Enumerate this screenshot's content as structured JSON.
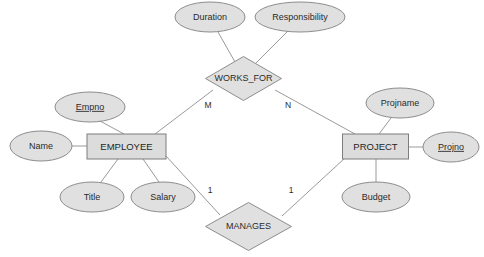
{
  "diagram": {
    "type": "entity-relationship-diagram",
    "background_color": "#ffffff",
    "shape_fill": "#e0e0e0",
    "shape_stroke": "#8c8c8c",
    "line_color": "#9a9a9a",
    "text_color": "#2b2b2b"
  },
  "entities": [
    {
      "id": "employee",
      "label": "EMPLOYEE",
      "shape": "rectangle",
      "x": 126.5,
      "y": 146.5,
      "width": 79,
      "height": 25
    },
    {
      "id": "project",
      "label": "PROJECT",
      "shape": "rectangle",
      "x": 375.5,
      "y": 146.5,
      "width": 66,
      "height": 25
    }
  ],
  "relationships": [
    {
      "id": "works_for",
      "label": "WORKS_FOR",
      "shape": "diamond",
      "x": 243.5,
      "y": 78.5,
      "rx": 38,
      "ry": 22
    },
    {
      "id": "manages",
      "label": "MANAGES",
      "shape": "diamond",
      "x": 248.5,
      "y": 226.5,
      "rx": 43,
      "ry": 24
    }
  ],
  "attributes": [
    {
      "id": "duration",
      "label": "Duration",
      "shape": "ellipse",
      "is_key": false,
      "x": 210,
      "y": 17,
      "rx": 35,
      "ry": 15,
      "owner": "works_for"
    },
    {
      "id": "responsibility",
      "label": "Responsibility",
      "shape": "ellipse",
      "is_key": false,
      "x": 300,
      "y": 17,
      "rx": 45,
      "ry": 15,
      "owner": "works_for"
    },
    {
      "id": "empno",
      "label": "Empno",
      "shape": "ellipse",
      "is_key": true,
      "x": 90,
      "y": 107,
      "rx": 35,
      "ry": 15,
      "owner": "employee"
    },
    {
      "id": "name",
      "label": "Name",
      "shape": "ellipse",
      "is_key": false,
      "x": 41,
      "y": 146,
      "rx": 31,
      "ry": 15,
      "owner": "employee"
    },
    {
      "id": "title",
      "label": "Title",
      "shape": "ellipse",
      "is_key": false,
      "x": 92,
      "y": 197,
      "rx": 32,
      "ry": 15,
      "owner": "employee"
    },
    {
      "id": "salary",
      "label": "Salary",
      "shape": "ellipse",
      "is_key": false,
      "x": 163,
      "y": 197,
      "rx": 32,
      "ry": 15,
      "owner": "employee"
    },
    {
      "id": "projname",
      "label": "Projname",
      "shape": "ellipse",
      "is_key": false,
      "x": 400,
      "y": 103,
      "rx": 34,
      "ry": 15,
      "owner": "project"
    },
    {
      "id": "projno",
      "label": "Projno",
      "shape": "ellipse",
      "is_key": true,
      "x": 451,
      "y": 147,
      "rx": 28,
      "ry": 15,
      "owner": "project"
    },
    {
      "id": "budget",
      "label": "Budget",
      "shape": "ellipse",
      "is_key": false,
      "x": 376,
      "y": 197,
      "rx": 34,
      "ry": 15,
      "owner": "project"
    }
  ],
  "cardinalities": [
    {
      "id": "works_for_employee",
      "label": "M",
      "x": 208,
      "y": 106
    },
    {
      "id": "works_for_project",
      "label": "N",
      "x": 288,
      "y": 106
    },
    {
      "id": "manages_employee",
      "label": "1",
      "x": 210,
      "y": 191
    },
    {
      "id": "manages_project",
      "label": "1",
      "x": 291,
      "y": 191
    }
  ],
  "connections": [
    {
      "id": "duration-worksfor",
      "x1": 218,
      "y1": 32,
      "x2": 235,
      "y2": 62
    },
    {
      "id": "responsibility-worksfor",
      "x1": 288,
      "y1": 31,
      "x2": 256,
      "y2": 63
    },
    {
      "id": "worksfor-employee",
      "x1": 213,
      "y1": 90,
      "x2": 155,
      "y2": 134
    },
    {
      "id": "worksfor-project",
      "x1": 275,
      "y1": 90,
      "x2": 355,
      "y2": 134
    },
    {
      "id": "empno-employee",
      "x1": 100,
      "y1": 121,
      "x2": 124,
      "y2": 134
    },
    {
      "id": "name-employee",
      "x1": 72,
      "y1": 146,
      "x2": 87,
      "y2": 146
    },
    {
      "id": "title-employee",
      "x1": 101,
      "y1": 182,
      "x2": 118,
      "y2": 159
    },
    {
      "id": "salary-employee",
      "x1": 159,
      "y1": 182,
      "x2": 143,
      "y2": 159
    },
    {
      "id": "employee-manages",
      "x1": 166,
      "y1": 156,
      "x2": 220,
      "y2": 215
    },
    {
      "id": "projname-project",
      "x1": 391,
      "y1": 118,
      "x2": 379,
      "y2": 134
    },
    {
      "id": "projno-project",
      "x1": 423,
      "y1": 147,
      "x2": 408,
      "y2": 147
    },
    {
      "id": "budget-project",
      "x1": 376,
      "y1": 182,
      "x2": 376,
      "y2": 159
    },
    {
      "id": "project-manages",
      "x1": 345,
      "y1": 158,
      "x2": 282,
      "y2": 216
    }
  ]
}
